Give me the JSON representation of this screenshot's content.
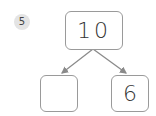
{
  "problem": {
    "number": "5"
  },
  "number_bond": {
    "whole": "10",
    "parts": [
      "",
      "6"
    ]
  },
  "colors": {
    "badge_fill": "#e4e4e4",
    "box_border": "#9a9a9a",
    "arrow": "#8a8a8a",
    "text": "#333333"
  }
}
